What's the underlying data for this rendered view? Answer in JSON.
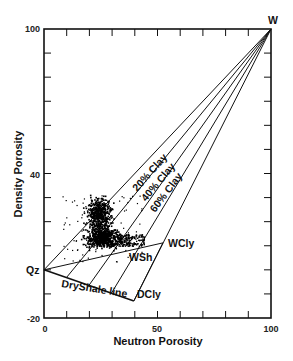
{
  "chart_data": {
    "type": "scatter",
    "title": "",
    "xlabel": "Neutron Porosity",
    "ylabel": "Density Porosity",
    "xlim": [
      0,
      100
    ],
    "ylim": [
      -20,
      100
    ],
    "x_tick_labels": [
      "0",
      "50",
      "100"
    ],
    "y_tick_labels": [
      "-20",
      "40",
      "100"
    ],
    "x_minor_ticks_every": 10,
    "y_minor_ticks_every": 10,
    "grid": false,
    "legend": null,
    "endpoints": {
      "Qz": {
        "x": 0,
        "y": 0,
        "label": "Qz"
      },
      "W": {
        "x": 100,
        "y": 100,
        "label": "W"
      },
      "DCly": {
        "x": 39.6,
        "y": -12.9,
        "label": "DCly"
      },
      "WCly": {
        "x": 52.4,
        "y": 11.2,
        "label": "WCly"
      },
      "WSh": {
        "x": 46,
        "y": 9,
        "label": "WSh"
      }
    },
    "lines": [
      {
        "name": "Qz-W",
        "from": [
          0,
          0
        ],
        "to": [
          100,
          100
        ]
      },
      {
        "name": "DryShale line",
        "from": [
          0,
          0
        ],
        "to": [
          39.6,
          -12.9
        ],
        "label": "DryShale line"
      },
      {
        "name": "DCly-WCly",
        "from": [
          39.6,
          -12.9
        ],
        "to": [
          52.4,
          11.2
        ]
      },
      {
        "name": "Qz-WCly shale line",
        "from": [
          0,
          0
        ],
        "to": [
          52.4,
          11.2
        ]
      },
      {
        "name": "DCly-W",
        "from": [
          39.6,
          -12.9
        ],
        "to": [
          100,
          100
        ]
      },
      {
        "name": "20% Clay",
        "from": [
          9.9,
          -3.2
        ],
        "to": [
          100,
          100
        ],
        "label": "20% Clay"
      },
      {
        "name": "40% Clay",
        "from": [
          19.8,
          -6.45
        ],
        "to": [
          100,
          100
        ],
        "label": "40% Clay"
      },
      {
        "name": "60% Clay",
        "from": [
          29.7,
          -9.7
        ],
        "to": [
          100,
          100
        ],
        "label": "60% Clay"
      }
    ],
    "annotations": [
      "W",
      "Qz",
      "WCly",
      "WSh",
      "DCly",
      "DryShale line",
      "20% Clay",
      "40% Clay",
      "60% Clay"
    ],
    "scatter_cluster": {
      "description": "dense cloud of data points",
      "main_core": {
        "x_range": [
          18,
          32
        ],
        "y_range": [
          8,
          28
        ]
      },
      "sparse_spread": {
        "x_range": [
          8,
          44
        ],
        "y_range": [
          2,
          32
        ]
      }
    }
  }
}
